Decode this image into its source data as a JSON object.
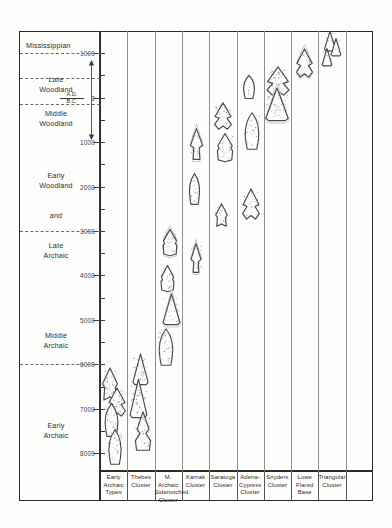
{
  "chart_data": {
    "type": "scatter",
    "ylabel": "Years (A.D. / B.C.)",
    "xlabel": "",
    "grid": true,
    "legend": "none",
    "y_axis": {
      "top_value": 1500,
      "bottom_value": 8400,
      "direction": "A.D. at top, B.C. increasing downward",
      "major_ticks": [
        {
          "label": "1000",
          "value": 1000,
          "era": "A.D."
        },
        {
          "label": "0",
          "value": 0,
          "era": "A.D./B.C."
        },
        {
          "label": "1000",
          "value": 1000,
          "era": "B.C."
        },
        {
          "label": "2000",
          "value": 2000,
          "era": "B.C."
        },
        {
          "label": "3000",
          "value": 3000,
          "era": "B.C."
        },
        {
          "label": "4000",
          "value": 4000,
          "era": "B.C."
        },
        {
          "label": "5000",
          "value": 5000,
          "era": "B.C."
        },
        {
          "label": "6000",
          "value": 6000,
          "era": "B.C."
        },
        {
          "label": "7000",
          "value": 7000,
          "era": "B.C."
        },
        {
          "label": "8000",
          "value": 8000,
          "era": "B.C."
        }
      ],
      "minor_ticks": [
        500,
        -500,
        -1500,
        -2500,
        -3500,
        -4500,
        -5500,
        -6500,
        -7500
      ]
    },
    "era_marker": {
      "above": "A.D.",
      "below": "B.C.",
      "at_value": 0
    },
    "periods": [
      {
        "name": "Mississippian",
        "lines": [
          "Mississippian"
        ],
        "top": 1500,
        "bottom": 1000,
        "align": "left"
      },
      {
        "name": "Late Woodland",
        "lines": [
          "Late",
          "Woodland"
        ],
        "top": 1000,
        "bottom": 450,
        "align": "center"
      },
      {
        "name": "Middle Woodland",
        "lines": [
          "Middle",
          "Woodland"
        ],
        "top": 450,
        "bottom": -150,
        "align": "center"
      },
      {
        "name": "Early Woodland and Late Archaic",
        "lines": [
          "Early",
          "Woodland"
        ],
        "top": -150,
        "bottom": -3000,
        "align": "center"
      },
      {
        "name": "and",
        "lines": [
          "and"
        ],
        "align": "center"
      },
      {
        "name": "Late Archaic",
        "lines": [
          "Late",
          "Archaic"
        ],
        "align": "center"
      },
      {
        "name": "Middle Archaic",
        "lines": [
          "Middle",
          "Archaic"
        ],
        "top": -3000,
        "bottom": -6000,
        "align": "center"
      },
      {
        "name": "Early Archaic",
        "lines": [
          "Early",
          "Archaic"
        ],
        "top": -6000,
        "bottom": -8400,
        "align": "center"
      }
    ],
    "period_boundaries": [
      1000,
      450,
      -150,
      -3000,
      -6000
    ],
    "categories": [
      "Early Archaic Types",
      "Thebes Cluster",
      "M. Archaic Sidenotched Cluster",
      "Karnak Cluster",
      "Saratoga Cluster",
      "Adena-Cypress Cluster",
      "Snyders Cluster",
      "Lowe Flared Base",
      "Triangular Cluster"
    ],
    "columns": [
      {
        "label_lines": [
          "Early",
          "Archaic",
          "Types"
        ],
        "range": [
          -6200,
          -8300
        ],
        "point_count": 4
      },
      {
        "label_lines": [
          "Thebes",
          "Cluster"
        ],
        "range": [
          -5800,
          -8000
        ],
        "point_count": 3
      },
      {
        "label_lines": [
          "M. Archaic",
          "Sidenotched",
          "Cluster"
        ],
        "range": [
          -2900,
          -6000
        ],
        "point_count": 4
      },
      {
        "label_lines": [
          "Karnak",
          "Cluster"
        ],
        "range": [
          -800,
          -4100
        ],
        "point_count": 3
      },
      {
        "label_lines": [
          "Saratoga",
          "Cluster"
        ],
        "range": [
          -200,
          -2900
        ],
        "point_count": 3
      },
      {
        "label_lines": [
          "Adena-",
          "Cypress",
          "Cluster"
        ],
        "range": [
          400,
          -2800
        ],
        "point_count": 3
      },
      {
        "label_lines": [
          "Snyders",
          "Cluster"
        ],
        "range": [
          500,
          -400
        ],
        "point_count": 3
      },
      {
        "label_lines": [
          "Lowe",
          "Flared",
          "Base"
        ],
        "range": [
          900,
          500
        ],
        "point_count": 1
      },
      {
        "label_lines": [
          "Triangular",
          "Cluster"
        ],
        "range": [
          1400,
          800
        ],
        "point_count": 3
      }
    ]
  }
}
